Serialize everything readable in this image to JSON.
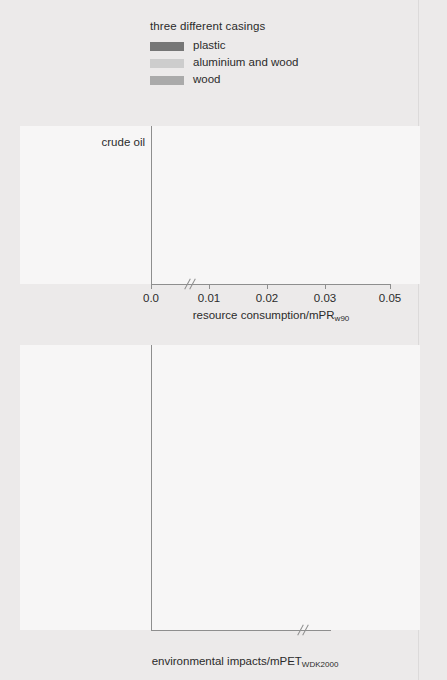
{
  "legend": {
    "title": "three different casings",
    "items": [
      {
        "label": "plastic",
        "color": "#767676"
      },
      {
        "label": "aluminium and wood",
        "color": "#cdcdcd"
      },
      {
        "label": "wood",
        "color": "#aaaaaa"
      }
    ]
  },
  "colors": {
    "plastic": "#767676",
    "aluminium_and_wood": "#cdcdcd",
    "wood": "#aaaaaa",
    "page_background": "#eceaea",
    "plot_background": "#f7f6f6",
    "axis": "#8e8e8e",
    "text": "#2b2b2b"
  },
  "chart_data": [
    {
      "type": "bar",
      "id": "resource-consumption",
      "orientation": "horizontal",
      "title": "",
      "xlabel": "resource consumption/mPR",
      "xlabel_sub": "w90",
      "ylabel": "",
      "xlim": [
        0,
        0.05
      ],
      "axis_break": {
        "after": 0.032,
        "resume": 0.0435
      },
      "ticks": [
        "0.0",
        "0.01",
        "0.02",
        "0.03",
        "0.05"
      ],
      "tick_values": [
        0.0,
        0.01,
        0.02,
        0.03,
        0.05
      ],
      "grid": false,
      "legend_position": "above-plot",
      "categories": [
        "crude oil",
        "coal",
        "natural gas",
        "aluminium",
        "iron",
        "wood"
      ],
      "series": [
        {
          "name": "plastic",
          "values": [
            0.0132,
            0.0004,
            0.0187,
            0.0006,
            0.0,
            0.0
          ]
        },
        {
          "name": "aluminium and wood",
          "values": [
            0.0055,
            0.003,
            0.0027,
            0.05,
            0.0,
            0.0037
          ]
        },
        {
          "name": "wood",
          "values": [
            0.004,
            0.0006,
            0.0027,
            0.0,
            0.0,
            0.0048
          ]
        }
      ],
      "annotations": [
        {
          "text": "0.05",
          "series": "aluminium and wood",
          "category": "aluminium"
        }
      ]
    },
    {
      "type": "bar",
      "id": "environmental-impacts",
      "orientation": "horizontal",
      "title": "",
      "xlabel": "environmental impacts/mPET",
      "xlabel_sub": "WDK2000",
      "ylabel": "",
      "xlim": [
        0,
        0.47
      ],
      "axis_break": {
        "after": 0.25,
        "resume": 0.36
      },
      "ticks": [
        "0",
        "0.1",
        "0.2",
        "0.4"
      ],
      "tick_values": [
        0,
        0.1,
        0.2,
        0.4
      ],
      "grid": false,
      "legend_position": "above-plot",
      "categories": [
        "global warming",
        "acidification",
        "nutrient enrichment",
        "photochemical ozone\nformation",
        "persistent toxicity",
        "human toxicity",
        "ecotoxicity",
        "hazardous waste",
        "nuclear waste",
        "slag and ashes",
        "bulk waste"
      ],
      "series": [
        {
          "name": "plastic",
          "values": [
            0.245,
            0.195,
            0.06,
            0.012,
            0.0,
            0.03,
            0.002,
            0.003,
            0.0,
            0.013,
            0.014
          ]
        },
        {
          "name": "aluminium and wood",
          "values": [
            0.165,
            0.1,
            0.022,
            0.021,
            0.0,
            0.012,
            0.0,
            0.195,
            0.012,
            0.1,
            0.47
          ]
        },
        {
          "name": "wood",
          "values": [
            0.04,
            0.038,
            0.016,
            0.012,
            0.0,
            0.01,
            0.0,
            0.002,
            0.0,
            0.058,
            0.022
          ]
        }
      ],
      "annotations": [
        {
          "text": "0.47",
          "series": "aluminium and wood",
          "category": "bulk waste"
        }
      ]
    }
  ]
}
